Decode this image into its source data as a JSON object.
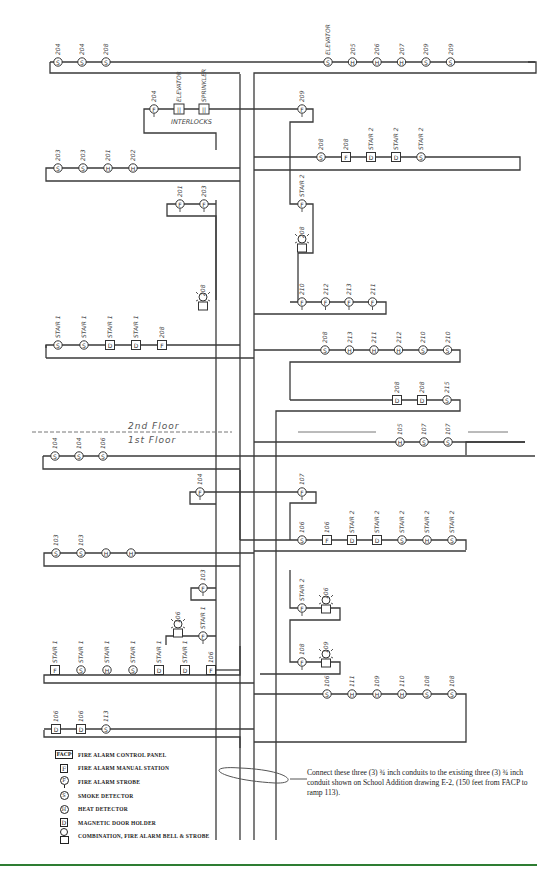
{
  "floors": {
    "upper": "2nd Floor",
    "lower": "1st Floor"
  },
  "interlocks": {
    "label": "INTERLOCKS",
    "devices": [
      "ELEVATOR",
      "SPRINKLER"
    ]
  },
  "chains": {
    "f2_top_left": [
      {
        "type": "S",
        "label": "204"
      },
      {
        "type": "S",
        "label": "204"
      },
      {
        "type": "S",
        "label": "208"
      }
    ],
    "f2_top_right": [
      {
        "type": "S",
        "label": "ELEVATOR"
      },
      {
        "type": "H",
        "label": "205"
      },
      {
        "type": "H",
        "label": "206"
      },
      {
        "type": "H",
        "label": "207"
      },
      {
        "type": "S",
        "label": "209"
      },
      {
        "type": "S",
        "label": "209"
      }
    ],
    "f2_interlock_strobe": {
      "type": "P",
      "label": "204"
    },
    "f2_strobe_209": {
      "type": "P",
      "label": "209"
    },
    "f2_stair2_row": [
      {
        "type": "S",
        "label": "208"
      },
      {
        "type": "F",
        "label": "208"
      },
      {
        "type": "D",
        "label": "STAIR 2"
      },
      {
        "type": "D",
        "label": "STAIR 2"
      },
      {
        "type": "S",
        "label": "STAIR 2"
      }
    ],
    "f2_mid_left": [
      {
        "type": "S",
        "label": "203"
      },
      {
        "type": "S",
        "label": "203"
      },
      {
        "type": "H",
        "label": "201"
      },
      {
        "type": "H",
        "label": "202"
      }
    ],
    "f2_strobes_left": [
      {
        "type": "P",
        "label": "201"
      },
      {
        "type": "P",
        "label": "203"
      }
    ],
    "f2_combo_left": {
      "type": "C",
      "label": "208"
    },
    "f2_stair2_strobe": {
      "type": "P",
      "label": "STAIR 2"
    },
    "f2_combo_right": {
      "type": "C",
      "label": "208"
    },
    "f2_strobes_right": [
      {
        "type": "P",
        "label": "210"
      },
      {
        "type": "P",
        "label": "212"
      },
      {
        "type": "P",
        "label": "213"
      },
      {
        "type": "P",
        "label": "211"
      }
    ],
    "f2_stair1_row": [
      {
        "type": "S",
        "label": "STAIR 1"
      },
      {
        "type": "S",
        "label": "STAIR 1"
      },
      {
        "type": "D",
        "label": "STAIR 1"
      },
      {
        "type": "D",
        "label": "STAIR 1"
      },
      {
        "type": "F",
        "label": "208"
      }
    ],
    "f2_lower_right": [
      {
        "type": "S",
        "label": "208"
      },
      {
        "type": "H",
        "label": "213"
      },
      {
        "type": "H",
        "label": "211"
      },
      {
        "type": "H",
        "label": "212"
      },
      {
        "type": "S",
        "label": "210"
      },
      {
        "type": "S",
        "label": "210"
      }
    ],
    "f2_door_row": [
      {
        "type": "D",
        "label": "208"
      },
      {
        "type": "D",
        "label": "208"
      },
      {
        "type": "S",
        "label": "215"
      }
    ],
    "f1_top_left": [
      {
        "type": "S",
        "label": "104"
      },
      {
        "type": "S",
        "label": "104"
      },
      {
        "type": "S",
        "label": "106"
      }
    ],
    "f1_top_right": [
      {
        "type": "H",
        "label": "105"
      },
      {
        "type": "S",
        "label": "107"
      },
      {
        "type": "S",
        "label": "107"
      }
    ],
    "f1_strobe_104": {
      "type": "P",
      "label": "104"
    },
    "f1_strobe_107": {
      "type": "P",
      "label": "107"
    },
    "f1_stair2_row": [
      {
        "type": "S",
        "label": "106"
      },
      {
        "type": "F",
        "label": "106"
      },
      {
        "type": "D",
        "label": "STAIR 2"
      },
      {
        "type": "D",
        "label": "STAIR 2"
      },
      {
        "type": "S",
        "label": "STAIR 2"
      },
      {
        "type": "H",
        "label": "STAIR 2"
      },
      {
        "type": "S",
        "label": "STAIR 2"
      }
    ],
    "f1_mid_left": [
      {
        "type": "S",
        "label": "103"
      },
      {
        "type": "S",
        "label": "103"
      },
      {
        "type": "H",
        "label": ""
      },
      {
        "type": "H",
        "label": ""
      }
    ],
    "f1_strobe_103": {
      "type": "P",
      "label": "103"
    },
    "f1_combo_106": {
      "type": "C",
      "label": "106"
    },
    "f1_strobe_stair1": {
      "type": "P",
      "label": "STAIR 1"
    },
    "f1_stair2_strobe": {
      "type": "P",
      "label": "STAIR 2"
    },
    "f1_combo_106b": {
      "type": "C",
      "label": "106"
    },
    "f1_strobe_108": {
      "type": "P",
      "label": "108"
    },
    "f1_combo_109": {
      "type": "C",
      "label": "109"
    },
    "f1_stair1_row": [
      {
        "type": "F",
        "label": "STAIR 1"
      },
      {
        "type": "S",
        "label": "STAIR 1"
      },
      {
        "type": "H",
        "label": "STAIR 1"
      },
      {
        "type": "S",
        "label": "STAIR 1"
      },
      {
        "type": "D",
        "label": "STAIR 1"
      },
      {
        "type": "D",
        "label": "STAIR 1"
      },
      {
        "type": "F",
        "label": "106"
      }
    ],
    "f1_lower_right": [
      {
        "type": "S",
        "label": "106"
      },
      {
        "type": "H",
        "label": "111"
      },
      {
        "type": "H",
        "label": "109"
      },
      {
        "type": "H",
        "label": "110"
      },
      {
        "type": "S",
        "label": "108"
      },
      {
        "type": "S",
        "label": "108"
      }
    ],
    "f1_bottom_left": [
      {
        "type": "D",
        "label": "106"
      },
      {
        "type": "D",
        "label": "106"
      },
      {
        "type": "S",
        "label": "113"
      }
    ]
  },
  "legend": [
    {
      "symbol": "FACP",
      "kind": "panel",
      "text": "FIRE ALARM CONTROL PANEL"
    },
    {
      "symbol": "F",
      "kind": "box",
      "text": "FIRE ALARM MANUAL STATION"
    },
    {
      "symbol": "P",
      "kind": "strobe",
      "text": "FIRE ALARM STROBE"
    },
    {
      "symbol": "S",
      "kind": "circle",
      "text": "SMOKE DETECTOR"
    },
    {
      "symbol": "H",
      "kind": "circle-bold",
      "text": "HEAT DETECTOR"
    },
    {
      "symbol": "D",
      "kind": "box",
      "text": "MAGNETIC DOOR HOLDER"
    },
    {
      "symbol": "combo",
      "kind": "combo",
      "text": "COMBINATION, FIRE ALARM BELL & STROBE"
    }
  ],
  "note": "Connect these three (3) ¾ inch conduits to the existing three (3) ¾ inch conduit shown on School Addition drawing E-2, (150 feet from FACP to ramp 113).",
  "colors": {
    "line": "#3a3a3a",
    "footer_rule": "#2e7d32"
  }
}
